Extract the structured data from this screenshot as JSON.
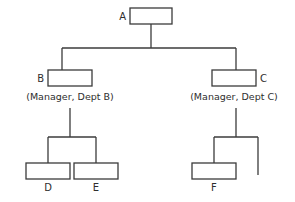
{
  "diagram": {
    "type": "organization-chart",
    "canvas": {
      "width": 295,
      "height": 202,
      "background": "#ffffff"
    },
    "stroke_color": "#3b3b3b",
    "box_fill": "#ffffff",
    "nodes": [
      {
        "id": "A",
        "label": "A",
        "label_position": "left",
        "caption": "",
        "box": {
          "x": 130,
          "y": 8,
          "width": 42,
          "height": 16
        },
        "label_point": {
          "x": 126,
          "y": 20
        }
      },
      {
        "id": "B",
        "label": "B",
        "label_position": "left",
        "caption": "(Manager,  Dept  B)",
        "box": {
          "x": 48,
          "y": 70,
          "width": 44,
          "height": 16
        },
        "label_point": {
          "x": 44,
          "y": 82
        },
        "caption_point": {
          "x": 70,
          "y": 100
        }
      },
      {
        "id": "C",
        "label": "C",
        "label_position": "right",
        "caption": "(Manager,  Dept  C)",
        "box": {
          "x": 212,
          "y": 70,
          "width": 44,
          "height": 16
        },
        "label_point": {
          "x": 260,
          "y": 82
        },
        "caption_point": {
          "x": 234,
          "y": 100
        }
      },
      {
        "id": "D",
        "label": "D",
        "label_position": "below",
        "caption": "",
        "box": {
          "x": 26,
          "y": 163,
          "width": 44,
          "height": 16
        },
        "label_point": {
          "x": 48,
          "y": 191
        }
      },
      {
        "id": "E",
        "label": "E",
        "label_position": "below",
        "caption": "",
        "box": {
          "x": 74,
          "y": 163,
          "width": 44,
          "height": 16
        },
        "label_point": {
          "x": 96,
          "y": 191
        }
      },
      {
        "id": "F",
        "label": "F",
        "label_position": "below",
        "caption": "",
        "box": {
          "x": 192,
          "y": 163,
          "width": 44,
          "height": 16
        },
        "label_point": {
          "x": 214,
          "y": 191
        }
      }
    ],
    "connectors": [
      {
        "name": "a-stem",
        "d": "M151,24 L151,48"
      },
      {
        "name": "top-bus",
        "d": "M62,48 L236,48"
      },
      {
        "name": "bus-drop-to-b",
        "d": "M62,48 L62,70"
      },
      {
        "name": "bus-drop-to-c",
        "d": "M236,48 L236,70"
      },
      {
        "name": "b-stem",
        "d": "M70,108 L70,137"
      },
      {
        "name": "b-bus",
        "d": "M48,137 L96,137"
      },
      {
        "name": "b-drop-to-d",
        "d": "M48,137 L48,163"
      },
      {
        "name": "b-drop-to-e",
        "d": "M96,137 L96,163"
      },
      {
        "name": "c-stem",
        "d": "M236,108 L236,137"
      },
      {
        "name": "c-bus",
        "d": "M214,137 L258,137"
      },
      {
        "name": "c-drop-to-f",
        "d": "M214,137 L214,163"
      },
      {
        "name": "c-drop-stub",
        "d": "M258,137 L258,175"
      }
    ],
    "edges": [
      {
        "from": "A",
        "to": "B"
      },
      {
        "from": "A",
        "to": "C"
      },
      {
        "from": "B",
        "to": "D"
      },
      {
        "from": "B",
        "to": "E"
      },
      {
        "from": "C",
        "to": "F"
      },
      {
        "from": "C",
        "to": ""
      }
    ]
  }
}
